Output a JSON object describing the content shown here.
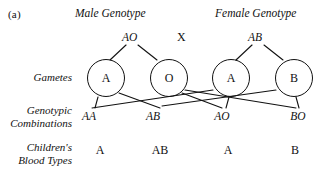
{
  "figure": {
    "label": "(a)",
    "cross_symbol": "X"
  },
  "headers": {
    "male": "Male Genotype",
    "female": "Female Genotype"
  },
  "parent_genotypes": {
    "male": "AO",
    "female": "AB"
  },
  "row_labels": {
    "gametes": "Gametes",
    "genotypic_combinations": "Genotypic\nCombinations",
    "genotypic_combinations_line1": "Genotypic",
    "genotypic_combinations_line2": "Combinations",
    "childrens_blood_types": "Children's\nBlood Types",
    "childrens_blood_types_line1": "Children's",
    "childrens_blood_types_line2": "Blood Types"
  },
  "gametes": [
    {
      "allele": "A",
      "parent": "male"
    },
    {
      "allele": "O",
      "parent": "male"
    },
    {
      "allele": "A",
      "parent": "female"
    },
    {
      "allele": "B",
      "parent": "female"
    }
  ],
  "genotypic_combinations": [
    {
      "genotype": "AA"
    },
    {
      "genotype": "AB"
    },
    {
      "genotype": "AO"
    },
    {
      "genotype": "BO"
    }
  ],
  "childrens_blood_types": [
    {
      "type": "A"
    },
    {
      "type": "AB"
    },
    {
      "type": "A"
    },
    {
      "type": "B"
    }
  ],
  "colors": {
    "ink": "#111111",
    "background": "#ffffff"
  }
}
